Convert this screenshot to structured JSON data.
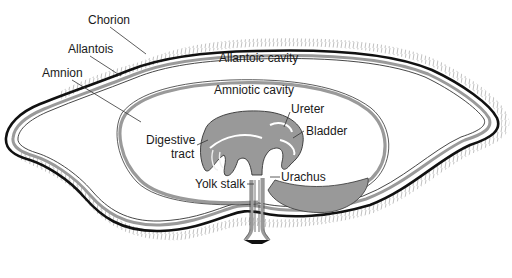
{
  "diagram": {
    "labels": {
      "chorion": "Chorion",
      "allantois": "Allantois",
      "amnion": "Amnion",
      "allantoic_cavity": "Allantoic cavity",
      "amniotic_cavity": "Amniotic cavity",
      "ureter": "Ureter",
      "bladder": "Bladder",
      "digestive_tract_line1": "Digestive",
      "digestive_tract_line2": "tract",
      "yolk_stalk": "Yolk stalk",
      "urachus": "Urachus"
    },
    "colors": {
      "membrane_outer": "#111111",
      "membrane_gray": "#9a9a9a",
      "embryo_fill": "#999999",
      "background": "#ffffff",
      "villi": "#555555"
    }
  }
}
